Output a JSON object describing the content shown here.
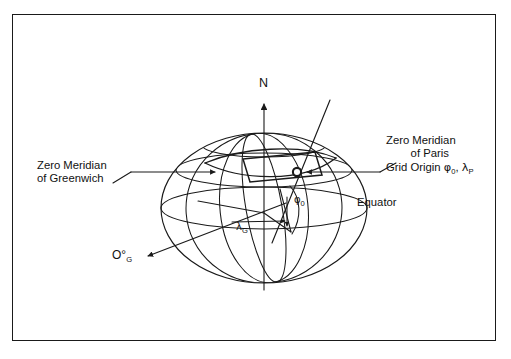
{
  "figure": {
    "type": "geodetic-ellipsoid-diagram",
    "title_visible": false,
    "border": {
      "color": "#1a1a1a",
      "style": "solid rectangle frame"
    },
    "background_color": "#ffffff",
    "line_color": "#1a1a1a"
  },
  "labels": {
    "north_axis": "N",
    "equator": "Equator",
    "zero_meridian_greenwich_line1": "Zero Meridian",
    "zero_meridian_greenwich_line2": "of Greenwich",
    "zero_meridian_paris_line1": "Zero Meridian",
    "zero_meridian_paris_line2": "of Paris",
    "grid_origin_prefix": "Grid Origin ",
    "grid_origin_phi": "φ",
    "grid_origin_phi_sub": "0",
    "grid_origin_separator": ", ",
    "grid_origin_lambda": "λ",
    "grid_origin_lambda_sub": "P",
    "angle_lambda_g": "λ",
    "angle_lambda_g_sub": "G",
    "angle_phi_0": "φ",
    "angle_phi_0_sub": "0",
    "zero_degrees_greenwich": "O°",
    "zero_degrees_greenwich_sub": "G"
  },
  "geometry": {
    "ellipsoid": {
      "center_x": 264,
      "center_y": 208,
      "radius_x": 103,
      "radius_y": 75
    },
    "polar_axis": {
      "top_y": 100,
      "bottom_y": 290,
      "x": 264,
      "arrow": "up"
    },
    "grid_origin_marker": {
      "x": 297,
      "y": 172,
      "shape": "small-open-circle"
    },
    "equator_ellipse_ry": 21,
    "grid_rectangle": "quadrilateral patch near grid origin",
    "meridians_count": 3,
    "parallels_count": 2
  }
}
